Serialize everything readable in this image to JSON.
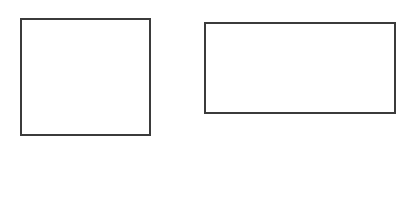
{
  "canvas": {
    "width": 403,
    "height": 200,
    "background": "#ffffff"
  },
  "shapes": [
    {
      "name": "left-square",
      "type": "rectangle",
      "x": 20,
      "y": 18,
      "width": 131,
      "height": 118,
      "stroke": "#3b3b3b",
      "stroke_width": 2,
      "fill": "#ffffff"
    },
    {
      "name": "right-wide-rectangle",
      "type": "rectangle",
      "x": 204,
      "y": 22,
      "width": 192,
      "height": 92,
      "stroke": "#3b3b3b",
      "stroke_width": 2,
      "fill": "#ffffff"
    }
  ]
}
